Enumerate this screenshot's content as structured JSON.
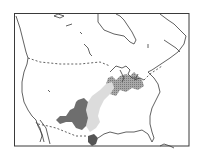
{
  "map": {
    "subject": "North America (United States and southern Canada)",
    "colors": {
      "background": "#ffffff",
      "outline": "#3a3a3a",
      "border_dashed": "#3a3a3a",
      "region_dark": "#6e6e6e",
      "region_light": "#dcdcdc",
      "region_stippled": "#9a9a9a",
      "region_gulf": "#555555"
    },
    "regions": [
      {
        "id": "southern-plains",
        "shade": "dark"
      },
      {
        "id": "mississippi-valley",
        "shade": "light"
      },
      {
        "id": "great-lakes-midwest",
        "shade": "stippled"
      },
      {
        "id": "south-texas-coast",
        "shade": "dark"
      }
    ],
    "labels": []
  }
}
